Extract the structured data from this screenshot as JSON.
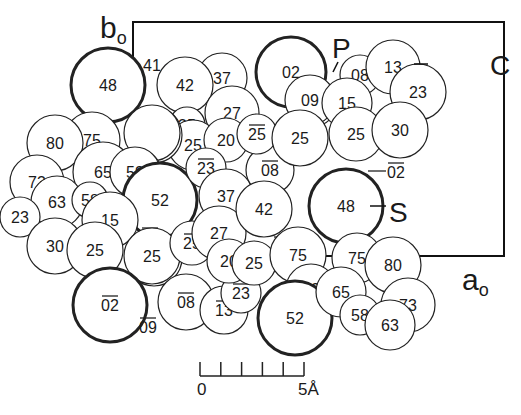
{
  "figure": {
    "axis_labels": {
      "b": {
        "label": "b",
        "subscript": "o",
        "x": 100,
        "y": 38
      },
      "a": {
        "label": "a",
        "subscript": "o",
        "x": 462,
        "y": 290
      }
    },
    "atom_labels": {
      "P": {
        "label": "P",
        "x": 332,
        "y": 58
      },
      "C": {
        "label": "C",
        "x": 490,
        "y": 75
      },
      "S": {
        "label": "S",
        "x": 389,
        "y": 222
      }
    },
    "scale_bar": {
      "start_label": "0",
      "end_label": "5Å",
      "ticks": 6
    },
    "unit_cell": {
      "x1": 133,
      "y1": 22,
      "x2": 504,
      "y2": 256
    },
    "atoms": [
      {
        "t": "41",
        "x": 152,
        "y": 65,
        "r": 0,
        "bold": false,
        "bar": false
      },
      {
        "t": "48",
        "x": 108,
        "y": 85,
        "r": 37,
        "bold": true,
        "bar": false
      },
      {
        "t": "37",
        "x": 222,
        "y": 78,
        "r": 25,
        "bold": false,
        "bar": false
      },
      {
        "t": "42",
        "x": 185,
        "y": 85,
        "r": 28,
        "bold": false,
        "bar": false
      },
      {
        "t": "27",
        "x": 232,
        "y": 113,
        "r": 27,
        "bold": false,
        "bar": false
      },
      {
        "t": "35",
        "x": 187,
        "y": 125,
        "r": 18,
        "bold": false,
        "bar": false
      },
      {
        "t": "25",
        "x": 193,
        "y": 145,
        "r": 25,
        "bold": false,
        "bar": false
      },
      {
        "t": "20",
        "x": 226,
        "y": 140,
        "r": 22,
        "bold": false,
        "bar": false
      },
      {
        "t": "",
        "x": 152,
        "y": 133,
        "r": 28,
        "bold": false,
        "bar": false,
        "double": true
      },
      {
        "t": "75",
        "x": 92,
        "y": 140,
        "r": 28,
        "bold": false,
        "bar": false
      },
      {
        "t": "80",
        "x": 55,
        "y": 143,
        "r": 28,
        "bold": false,
        "bar": false
      },
      {
        "t": "65",
        "x": 103,
        "y": 172,
        "r": 30,
        "bold": false,
        "bar": false
      },
      {
        "t": "59",
        "x": 135,
        "y": 172,
        "r": 25,
        "bold": false,
        "bar": false,
        "double": true
      },
      {
        "t": "73",
        "x": 37,
        "y": 182,
        "r": 27,
        "bold": false,
        "bar": false
      },
      {
        "t": "63",
        "x": 57,
        "y": 202,
        "r": 26,
        "bold": false,
        "bar": false
      },
      {
        "t": "58",
        "x": 90,
        "y": 200,
        "r": 18,
        "bold": false,
        "bar": false
      },
      {
        "t": "52",
        "x": 160,
        "y": 200,
        "r": 37,
        "bold": true,
        "bar": false
      },
      {
        "t": "23",
        "x": 20,
        "y": 217,
        "r": 20,
        "bold": false,
        "bar": false
      },
      {
        "t": "15",
        "x": 110,
        "y": 220,
        "r": 28,
        "bold": false,
        "bar": false
      },
      {
        "t": "30",
        "x": 55,
        "y": 246,
        "r": 28,
        "bold": false,
        "bar": false
      },
      {
        "t": "25",
        "x": 95,
        "y": 250,
        "r": 28,
        "bold": false,
        "bar": false
      },
      {
        "t": "09",
        "x": 150,
        "y": 237,
        "r": 0,
        "bold": false,
        "bar": true
      },
      {
        "t": "25",
        "x": 152,
        "y": 256,
        "r": 28,
        "bold": false,
        "bar": false,
        "double": true
      },
      {
        "t": "02",
        "x": 110,
        "y": 305,
        "r": 37,
        "bold": true,
        "bar": true
      },
      {
        "t": "09",
        "x": 148,
        "y": 327,
        "r": 0,
        "bold": false,
        "bar": true
      },
      {
        "t": "08",
        "x": 186,
        "y": 302,
        "r": 28,
        "bold": false,
        "bar": true
      },
      {
        "t": "13",
        "x": 224,
        "y": 310,
        "r": 24,
        "bold": false,
        "bar": true
      },
      {
        "t": "25",
        "x": 192,
        "y": 243,
        "r": 22,
        "bold": false,
        "bar": true
      },
      {
        "t": "23",
        "x": 241,
        "y": 293,
        "r": 20,
        "bold": false,
        "bar": true
      },
      {
        "t": "23",
        "x": 206,
        "y": 168,
        "r": 20,
        "bold": false,
        "bar": true
      },
      {
        "t": "37",
        "x": 226,
        "y": 196,
        "r": 27,
        "bold": false,
        "bar": false
      },
      {
        "t": "27",
        "x": 219,
        "y": 233,
        "r": 27,
        "bold": false,
        "bar": false
      },
      {
        "t": "20",
        "x": 229,
        "y": 261,
        "r": 22,
        "bold": false,
        "bar": false
      },
      {
        "t": "25",
        "x": 254,
        "y": 263,
        "r": 22,
        "bold": false,
        "bar": false
      },
      {
        "t": "08",
        "x": 270,
        "y": 170,
        "r": 24,
        "bold": false,
        "bar": true
      },
      {
        "t": "42",
        "x": 264,
        "y": 209,
        "r": 28,
        "bold": false,
        "bar": false
      },
      {
        "t": "35",
        "x": 282,
        "y": 246,
        "r": 0,
        "bold": false,
        "bar": true
      },
      {
        "t": "25",
        "x": 257,
        "y": 134,
        "r": 20,
        "bold": false,
        "bar": true
      },
      {
        "t": "02",
        "x": 291,
        "y": 72,
        "r": 35,
        "bold": true,
        "bar": false
      },
      {
        "t": "09",
        "x": 310,
        "y": 100,
        "r": 25,
        "bold": false,
        "bar": false,
        "double": true
      },
      {
        "t": "15",
        "x": 285,
        "y": 146,
        "r": 0,
        "bold": false,
        "bar": true
      },
      {
        "t": "25",
        "x": 300,
        "y": 138,
        "r": 28,
        "bold": false,
        "bar": false
      },
      {
        "t": "08",
        "x": 360,
        "y": 75,
        "r": 20,
        "bold": false,
        "bar": false
      },
      {
        "t": "13",
        "x": 393,
        "y": 67,
        "r": 27,
        "bold": false,
        "bar": false
      },
      {
        "t": "23",
        "x": 418,
        "y": 92,
        "r": 28,
        "bold": false,
        "bar": false
      },
      {
        "t": "15",
        "x": 347,
        "y": 103,
        "r": 25,
        "bold": false,
        "bar": false
      },
      {
        "t": "25",
        "x": 356,
        "y": 134,
        "r": 27,
        "bold": false,
        "bar": false
      },
      {
        "t": "30",
        "x": 400,
        "y": 130,
        "r": 28,
        "bold": false,
        "bar": false
      },
      {
        "t": "02",
        "x": 396,
        "y": 172,
        "r": 0,
        "bold": false,
        "bar": true
      },
      {
        "t": "48",
        "x": 346,
        "y": 206,
        "r": 37,
        "bold": true,
        "bar": false
      },
      {
        "t": "75",
        "x": 298,
        "y": 255,
        "r": 28,
        "bold": false,
        "bar": false
      },
      {
        "t": "59",
        "x": 311,
        "y": 289,
        "r": 25,
        "bold": false,
        "bar": false,
        "double": true
      },
      {
        "t": "52",
        "x": 295,
        "y": 318,
        "r": 37,
        "bold": true,
        "bar": false
      },
      {
        "t": "75",
        "x": 357,
        "y": 258,
        "r": 25,
        "bold": false,
        "bar": false
      },
      {
        "t": "80",
        "x": 393,
        "y": 265,
        "r": 28,
        "bold": false,
        "bar": false
      },
      {
        "t": "65",
        "x": 341,
        "y": 292,
        "r": 25,
        "bold": false,
        "bar": false
      },
      {
        "t": "73",
        "x": 408,
        "y": 305,
        "r": 27,
        "bold": false,
        "bar": false
      },
      {
        "t": "58",
        "x": 360,
        "y": 315,
        "r": 20,
        "bold": false,
        "bar": false
      },
      {
        "t": "63",
        "x": 390,
        "y": 325,
        "r": 25,
        "bold": false,
        "bar": false
      }
    ]
  }
}
